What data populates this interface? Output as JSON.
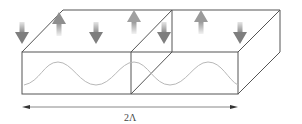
{
  "diagram": {
    "title": "",
    "dimension_label": "2Λ",
    "colors": {
      "edge": "#555555",
      "wave": "#b8b8b8",
      "arrow_dark": "#888888",
      "arrow_light": "#dddddd"
    },
    "blocks": [
      {
        "name": "left-block",
        "magnetization_arrows": [
          "down",
          "up",
          "down",
          "up"
        ]
      },
      {
        "name": "right-block",
        "magnetization_arrows": [
          "up",
          "down"
        ]
      }
    ],
    "arrows": [
      {
        "x": 22,
        "dir": "down"
      },
      {
        "x": 59,
        "dir": "up"
      },
      {
        "x": 96,
        "dir": "down"
      },
      {
        "x": 134,
        "dir": "up"
      },
      {
        "x": 164,
        "dir": "down"
      },
      {
        "x": 201,
        "dir": "up"
      },
      {
        "x": 240,
        "dir": "down"
      }
    ]
  }
}
